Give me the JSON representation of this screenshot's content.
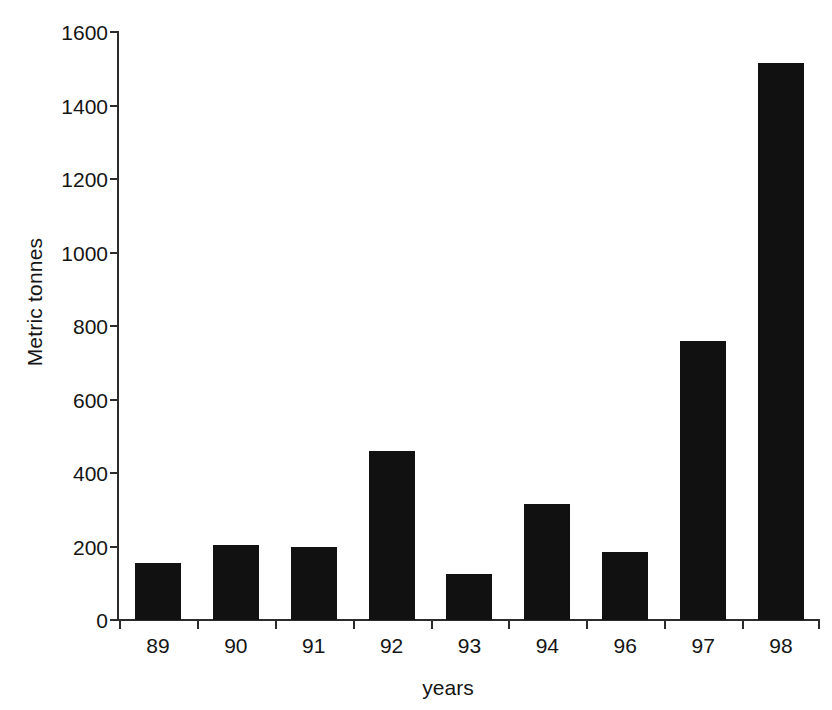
{
  "chart_data": {
    "type": "bar",
    "title": "",
    "subtitle": "",
    "xlabel": "years",
    "ylabel": "Metric tonnes",
    "categories": [
      "89",
      "90",
      "91",
      "92",
      "93",
      "94",
      "96",
      "97",
      "98"
    ],
    "values": [
      155,
      205,
      200,
      460,
      125,
      315,
      185,
      760,
      1515
    ],
    "series": [
      {
        "name": "Metric tonnes",
        "values": [
          155,
          205,
          200,
          460,
          125,
          315,
          185,
          760,
          1515
        ]
      }
    ],
    "ylim": [
      0,
      1600
    ],
    "yticks": [
      0,
      200,
      400,
      600,
      800,
      1000,
      1200,
      1400,
      1600
    ],
    "ytick_labels": [
      "0",
      "200",
      "400",
      "600",
      "800",
      "1000",
      "1200",
      "1400",
      "1600"
    ],
    "grid": false,
    "legend": false,
    "legend_position": "none",
    "bar_color": "#111111",
    "axis_color": "#2c2c2c",
    "background_color": "#ffffff",
    "annotations": []
  }
}
